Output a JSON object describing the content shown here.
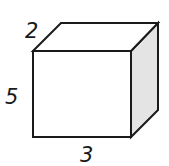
{
  "figure": {
    "type": "rectangular-prism",
    "dimensions": {
      "depth": {
        "label": "2",
        "position": "top-left edge"
      },
      "height": {
        "label": "5",
        "position": "left edge"
      },
      "width": {
        "label": "3",
        "position": "bottom edge"
      }
    },
    "colors": {
      "stroke": "#1a1a1a",
      "front_face": "#ffffff",
      "top_face": "#ffffff",
      "side_face": "#e4e4e4"
    }
  }
}
